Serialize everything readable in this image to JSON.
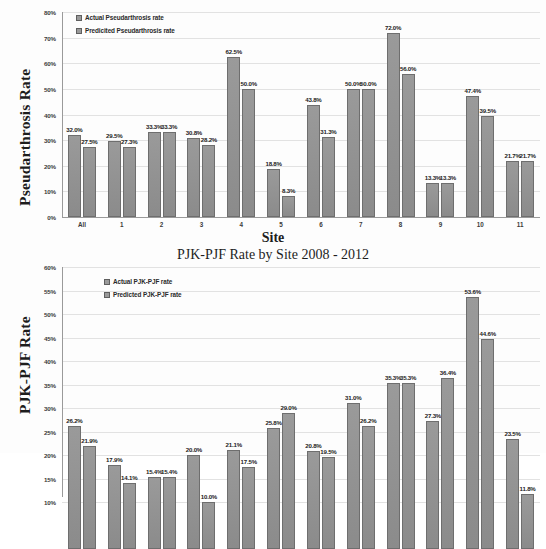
{
  "page": {
    "background": "#fdfdfd",
    "bar_color": "#8f8f8f",
    "bar_border_color": "#6e6e6e",
    "grid_color": "#e2e2e2"
  },
  "chart_data": [
    {
      "id": "pseudarthrosis",
      "type": "bar",
      "title": "",
      "xlabel": "Site",
      "ylabel": "Pseudarthrosis Rate",
      "ylim": [
        0,
        80
      ],
      "ytick_step": 10,
      "ytick_labels": [
        "80%",
        "70%",
        "60%",
        "50%",
        "40%",
        "30%",
        "20%",
        "10%",
        "0%"
      ],
      "grid": true,
      "legend_position": "top-left",
      "categories": [
        "All",
        "1",
        "2",
        "3",
        "4",
        "5",
        "6",
        "7",
        "8",
        "9",
        "10",
        "11"
      ],
      "series": [
        {
          "name": "Actual Pseudarthrosis rate",
          "values": [
            32.0,
            29.5,
            33.3,
            30.8,
            62.5,
            18.8,
            43.8,
            50.0,
            72.0,
            13.3,
            47.4,
            21.7
          ],
          "labels": [
            "32.0%",
            "29.5%",
            "33.3%",
            "30.8%",
            "62.5%",
            "18.8%",
            "43.8%",
            "50.0%",
            "72.0%",
            "13.3%",
            "47.4%",
            "21.7%"
          ]
        },
        {
          "name": "Predicited Pseudarthrosis rate",
          "values": [
            27.5,
            27.3,
            33.3,
            28.2,
            50.0,
            8.3,
            31.3,
            50.0,
            56.0,
            13.3,
            39.5,
            21.7
          ],
          "labels": [
            "27.5%",
            "27.3%",
            "33.3%",
            "28.2%",
            "50.0%",
            "8.3%",
            "31.3%",
            "50.0%",
            "56.0%",
            "13.3%",
            "39.5%",
            "21.7%"
          ]
        }
      ]
    },
    {
      "id": "pjk-pjf",
      "type": "bar",
      "title": "PJK-PJF Rate by Site 2008 - 2012",
      "xlabel": "",
      "ylabel": "PJK-PJF Rate",
      "ylim": [
        0,
        60
      ],
      "ytick_step": 5,
      "ytick_labels": [
        "60%",
        "55%",
        "50%",
        "45%",
        "40%",
        "35%",
        "30%",
        "25%",
        "20%",
        "15%",
        "10%"
      ],
      "grid": true,
      "legend_position": "top-left",
      "categories": [
        "All",
        "1",
        "2",
        "3",
        "4",
        "5",
        "6",
        "7",
        "8",
        "9",
        "10",
        "11"
      ],
      "series": [
        {
          "name": "Actual PJK-PJF rate",
          "values": [
            26.2,
            17.9,
            15.4,
            20.0,
            21.1,
            25.8,
            20.8,
            31.0,
            35.3,
            27.3,
            53.6,
            23.5
          ],
          "labels": [
            "26.2%",
            "17.9%",
            "15.4%",
            "20.0%",
            "21.1%",
            "25.8%",
            "20.8%",
            "31.0%",
            "35.3%",
            "27.3%",
            "53.6%",
            "23.5%"
          ]
        },
        {
          "name": "Predicted PJK-PJF rate",
          "values": [
            21.9,
            14.1,
            15.4,
            10.0,
            17.5,
            29.0,
            19.5,
            26.2,
            35.3,
            36.4,
            44.6,
            11.8
          ],
          "labels": [
            "21.9%",
            "14.1%",
            "15.4%",
            "10.0%",
            "17.5%",
            "29.0%",
            "19.5%",
            "26.2%",
            "35.3%",
            "36.4%",
            "44.6%",
            "11.8%"
          ]
        }
      ]
    }
  ]
}
